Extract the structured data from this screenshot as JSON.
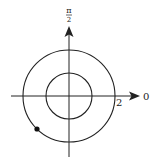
{
  "diagram": {
    "type": "polar-coordinate-graph",
    "center": {
      "x": 69,
      "y": 96
    },
    "axes": {
      "angle_zero_label": "0",
      "angle_pi_over_2_label_num": "π",
      "angle_pi_over_2_label_den": "2"
    },
    "radius_tick_label": "2",
    "circles": [
      {
        "name": "inner-circle",
        "radius_units": 1
      },
      {
        "name": "outer-circle",
        "radius_units": 2
      }
    ],
    "point": {
      "description": "filled point on outer circle in third quadrant",
      "angle": "5π/4 (approx)",
      "r": 2
    },
    "colors": {
      "stroke": "#222222",
      "background": "#ffffff"
    }
  }
}
